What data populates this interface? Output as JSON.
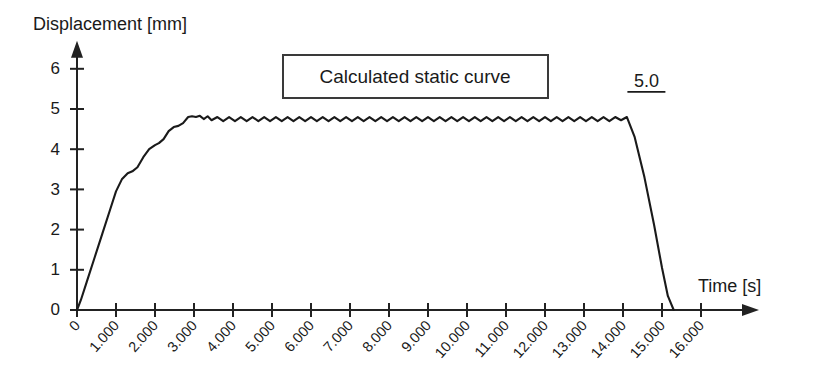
{
  "chart_data": {
    "type": "line",
    "title": "",
    "xlabel": "Time [s]",
    "ylabel": "Displacement [mm]",
    "xlim": [
      0,
      16
    ],
    "ylim": [
      0,
      6.4
    ],
    "grid": false,
    "legend_position": "top-center",
    "legend_entries": [
      "Calculated static curve"
    ],
    "xtick_labels": [
      "0",
      "1.000",
      "2.000",
      "3.000",
      "4.000",
      "5.000",
      "6.000",
      "7.000",
      "8.000",
      "9.000",
      "10.000",
      "11.000",
      "12.000",
      "13.000",
      "14.000",
      "15.000",
      "16.000"
    ],
    "xtick_values": [
      0,
      1,
      2,
      3,
      4,
      5,
      6,
      7,
      8,
      9,
      10,
      11,
      12,
      13,
      14,
      15,
      16
    ],
    "ytick_labels": [
      "0",
      "1",
      "2",
      "3",
      "4",
      "5",
      "6"
    ],
    "ytick_values": [
      0,
      1,
      2,
      3,
      4,
      5,
      6
    ],
    "annotations": [
      {
        "text": "5.0",
        "x": 14.6,
        "y": 5.55,
        "underlined": true
      }
    ],
    "series": [
      {
        "name": "Calculated static curve",
        "color": "#1a1a1a",
        "x": [
          0.0,
          0.1,
          0.25,
          0.45,
          0.65,
          0.85,
          1.0,
          1.15,
          1.3,
          1.42,
          1.55,
          1.7,
          1.85,
          2.0,
          2.1,
          2.22,
          2.35,
          2.48,
          2.6,
          2.72,
          2.85,
          2.95,
          3.05,
          3.15,
          3.25,
          3.35,
          3.45,
          3.6,
          3.75,
          3.9,
          4.05,
          4.2,
          4.35,
          4.5,
          4.65,
          4.8,
          4.95,
          5.1,
          5.25,
          5.4,
          5.55,
          5.7,
          5.85,
          6.0,
          6.15,
          6.3,
          6.45,
          6.6,
          6.75,
          6.9,
          7.05,
          7.2,
          7.35,
          7.5,
          7.65,
          7.8,
          7.95,
          8.1,
          8.25,
          8.4,
          8.55,
          8.7,
          8.85,
          9.0,
          9.15,
          9.3,
          9.45,
          9.6,
          9.75,
          9.9,
          10.05,
          10.2,
          10.35,
          10.5,
          10.65,
          10.8,
          10.95,
          11.1,
          11.25,
          11.4,
          11.55,
          11.7,
          11.85,
          12.0,
          12.15,
          12.3,
          12.45,
          12.6,
          12.75,
          12.9,
          13.05,
          13.2,
          13.35,
          13.5,
          13.65,
          13.8,
          13.95,
          14.1,
          14.3,
          14.55,
          14.8,
          15.0,
          15.15,
          15.3
        ],
        "y": [
          0.0,
          0.25,
          0.7,
          1.3,
          1.9,
          2.5,
          2.95,
          3.25,
          3.4,
          3.45,
          3.55,
          3.8,
          4.0,
          4.1,
          4.15,
          4.25,
          4.45,
          4.55,
          4.58,
          4.65,
          4.8,
          4.82,
          4.8,
          4.83,
          4.75,
          4.82,
          4.72,
          4.8,
          4.7,
          4.8,
          4.7,
          4.8,
          4.7,
          4.8,
          4.7,
          4.8,
          4.7,
          4.8,
          4.7,
          4.8,
          4.7,
          4.8,
          4.7,
          4.8,
          4.7,
          4.8,
          4.7,
          4.8,
          4.7,
          4.8,
          4.7,
          4.8,
          4.7,
          4.8,
          4.7,
          4.8,
          4.7,
          4.8,
          4.7,
          4.8,
          4.7,
          4.8,
          4.7,
          4.8,
          4.7,
          4.8,
          4.7,
          4.8,
          4.7,
          4.8,
          4.7,
          4.8,
          4.7,
          4.8,
          4.7,
          4.8,
          4.7,
          4.8,
          4.7,
          4.8,
          4.7,
          4.8,
          4.7,
          4.8,
          4.7,
          4.8,
          4.7,
          4.8,
          4.7,
          4.8,
          4.7,
          4.8,
          4.7,
          4.8,
          4.7,
          4.8,
          4.72,
          4.8,
          4.3,
          3.3,
          2.1,
          1.05,
          0.35,
          0.0
        ]
      }
    ]
  }
}
